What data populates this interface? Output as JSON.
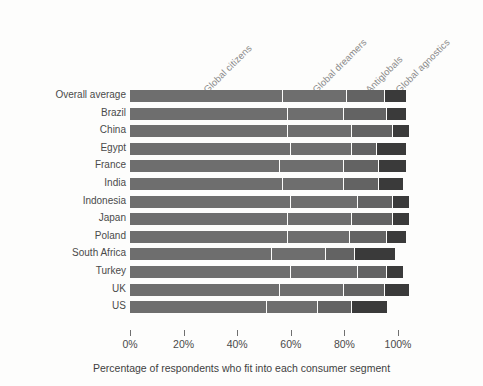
{
  "chart_data": {
    "type": "bar",
    "subtype": "stacked-horizontal",
    "title": "",
    "xlabel": "Percentage of respondents who fit into each consumer segment",
    "ylabel": "",
    "xlim": [
      0,
      105
    ],
    "grid": false,
    "legend_position": "top-rotated-inline",
    "xticks": [
      "0%",
      "20%",
      "40%",
      "60%",
      "80%",
      "100%"
    ],
    "xtick_values": [
      0,
      20,
      40,
      60,
      80,
      100
    ],
    "categories": [
      "Overall average",
      "Brazil",
      "China",
      "Egypt",
      "France",
      "India",
      "Indonesia",
      "Japan",
      "Poland",
      "South Africa",
      "Turkey",
      "UK",
      "US"
    ],
    "series": [
      {
        "name": "Global citizens",
        "color": "#6e6e6e",
        "values": [
          57,
          59,
          59,
          60,
          56,
          57,
          60,
          59,
          59,
          53,
          60,
          56,
          51
        ]
      },
      {
        "name": "Global dreamers",
        "color": "#6e6e6e",
        "values": [
          24,
          21,
          24,
          23,
          24,
          23,
          25,
          24,
          23,
          20,
          25,
          24,
          19
        ]
      },
      {
        "name": "Antiglobals",
        "color": "#636363",
        "values": [
          14,
          16,
          15,
          9,
          13,
          13,
          13,
          15,
          14,
          11,
          11,
          15,
          13
        ]
      },
      {
        "name": "Global agnostics",
        "color": "#3a3a3a",
        "values": [
          8,
          7,
          6,
          11,
          10,
          9,
          6,
          6,
          7,
          15,
          6,
          9,
          13
        ]
      }
    ]
  },
  "axis": {
    "x_title": "Percentage of respondents who fit into each consumer segment"
  },
  "colors": {
    "background": "#fdfdfc",
    "text": "#4a4a4a",
    "label_muted": "#8b8b8b",
    "tick": "#6f6f6f"
  }
}
